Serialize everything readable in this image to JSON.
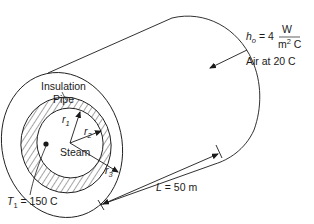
{
  "diagram": {
    "type": "insulated-pipe-cross-section",
    "labels": {
      "insulation": "Insulation",
      "pipe": "Pipe",
      "steam": "Steam",
      "r1": "r",
      "r1_sub": "1",
      "r2": "r",
      "r2_sub": "2",
      "r3": "r",
      "r3_sub": "3",
      "t1_symbol": "T",
      "t1_sub": "1",
      "t1_value": " = 150 C",
      "length_symbol": "L",
      "length_value": " = 50 m",
      "h_symbol": "h",
      "h_sub": "o",
      "h_value": " = 4",
      "h_unit_num": "W",
      "h_unit_den_m": "m",
      "h_unit_den_exp": "2",
      "h_unit_den_c": " C",
      "air": "Air at 20 C"
    },
    "colors": {
      "stroke": "#1a1a1a",
      "background": "#ffffff",
      "hatch": "#1a1a1a"
    }
  }
}
